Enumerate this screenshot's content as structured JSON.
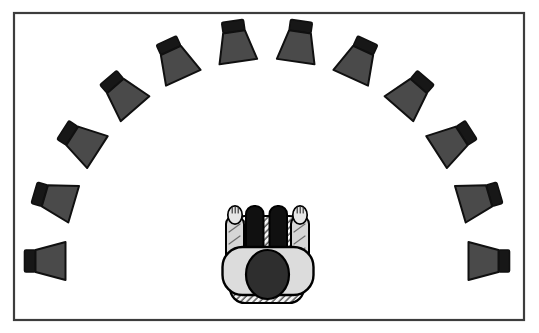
{
  "figure": {
    "type": "diagram",
    "background_color": "#ffffff",
    "frame": {
      "stroke_color": "#3d3d3d"
    },
    "speaker_array": {
      "count": 12,
      "arc_start_deg": 0,
      "arc_end_deg": 180,
      "radius_px": 222,
      "center": {
        "x": 267,
        "y": 261
      },
      "icon": {
        "name": "loudspeaker-icon",
        "orientation": "mouth-facing-listener",
        "cone_fill": "#4a4a4a",
        "cone_stroke": "#101010",
        "back_fill": "#171717",
        "mouth_width": 38,
        "back_width": 22,
        "cone_depth": 30,
        "back_depth": 11
      }
    },
    "listener": {
      "pose": "seated-top-view-facing-speaker-arc",
      "colors": {
        "head": "#2e2e2e",
        "legs": "#101010",
        "sleeves": "#d6d6d6",
        "hands": "#e6e6e6",
        "torso": "#dcdcdc",
        "outline": "#000000",
        "chair_hatch_line": "#1c1c1c",
        "chair_base": "#f7f7f7"
      }
    }
  }
}
